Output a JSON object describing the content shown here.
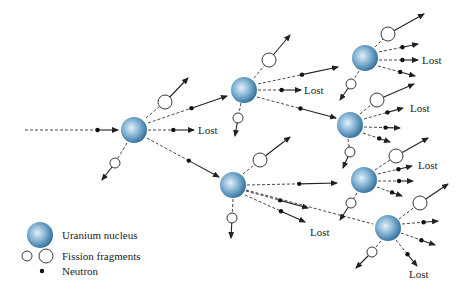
{
  "diagram": {
    "colors": {
      "nucleus_light": "#dcebf4",
      "nucleus_mid": "#7fb0d2",
      "nucleus_dark": "#2f6f9c",
      "line": "#222222"
    },
    "lost_label": "Lost",
    "nuclei": [
      {
        "id": "n1",
        "x": 134,
        "y": 130
      },
      {
        "id": "n2",
        "x": 244,
        "y": 90
      },
      {
        "id": "n3",
        "x": 365,
        "y": 58
      },
      {
        "id": "n4",
        "x": 350,
        "y": 125
      },
      {
        "id": "n5",
        "x": 364,
        "y": 180
      },
      {
        "id": "n6",
        "x": 388,
        "y": 228
      },
      {
        "id": "n7",
        "x": 233,
        "y": 185
      }
    ],
    "neutron_paths": [
      {
        "x1": 25,
        "y1": 130,
        "x2": 118,
        "y2": 130,
        "dot": 0.78,
        "lost": false
      },
      {
        "x1": 148,
        "y1": 130,
        "x2": 194,
        "y2": 130,
        "dot": 0.55,
        "lost": true,
        "lx": 198,
        "ly": 134
      },
      {
        "x1": 148,
        "y1": 123,
        "x2": 227,
        "y2": 96,
        "dot": 0.55,
        "lost": false
      },
      {
        "x1": 147,
        "y1": 138,
        "x2": 219,
        "y2": 177,
        "dot": 0.58,
        "lost": false
      },
      {
        "x1": 258,
        "y1": 90,
        "x2": 301,
        "y2": 90,
        "dot": 0.55,
        "lost": true,
        "lx": 304,
        "ly": 94
      },
      {
        "x1": 258,
        "y1": 84,
        "x2": 338,
        "y2": 67,
        "dot": 0.55,
        "lost": false
      },
      {
        "x1": 257,
        "y1": 97,
        "x2": 336,
        "y2": 118,
        "dot": 0.55,
        "lost": false
      },
      {
        "x1": 247,
        "y1": 185,
        "x2": 337,
        "y2": 183,
        "dot": 0.58,
        "lost": false
      },
      {
        "x1": 246,
        "y1": 191,
        "x2": 308,
        "y2": 208,
        "dot": 0.55,
        "lost": false
      },
      {
        "x1": 245,
        "y1": 195,
        "x2": 305,
        "y2": 222,
        "dot": 0.6,
        "lost": true,
        "lx": 310,
        "ly": 236
      },
      {
        "x1": 246,
        "y1": 190,
        "x2": 373,
        "y2": 224,
        "dot": -1,
        "lost": false
      },
      {
        "x1": 379,
        "y1": 52,
        "x2": 418,
        "y2": 44,
        "dot": 0.6,
        "lost": false
      },
      {
        "x1": 379,
        "y1": 60,
        "x2": 418,
        "y2": 60,
        "dot": 0.6,
        "lost": true,
        "lx": 422,
        "ly": 64
      },
      {
        "x1": 378,
        "y1": 66,
        "x2": 415,
        "y2": 76,
        "dot": 0.6,
        "lost": false
      },
      {
        "x1": 364,
        "y1": 119,
        "x2": 403,
        "y2": 108,
        "dot": 0.6,
        "lost": true,
        "lx": 410,
        "ly": 112
      },
      {
        "x1": 364,
        "y1": 127,
        "x2": 400,
        "y2": 128,
        "dot": 0.6,
        "lost": false
      },
      {
        "x1": 363,
        "y1": 133,
        "x2": 390,
        "y2": 142,
        "dot": 0.6,
        "lost": false
      },
      {
        "x1": 378,
        "y1": 174,
        "x2": 412,
        "y2": 166,
        "dot": 0.6,
        "lost": true,
        "lx": 418,
        "ly": 169
      },
      {
        "x1": 378,
        "y1": 181,
        "x2": 413,
        "y2": 181,
        "dot": 0.6,
        "lost": false
      },
      {
        "x1": 377,
        "y1": 187,
        "x2": 402,
        "y2": 196,
        "dot": 0.6,
        "lost": false
      },
      {
        "x1": 402,
        "y1": 224,
        "x2": 438,
        "y2": 221,
        "dot": 0.6,
        "lost": false
      },
      {
        "x1": 401,
        "y1": 233,
        "x2": 435,
        "y2": 245,
        "dot": 0.6,
        "lost": false
      },
      {
        "x1": 396,
        "y1": 240,
        "x2": 417,
        "y2": 266,
        "dot": 0.55,
        "lost": true,
        "lx": 409,
        "ly": 278
      }
    ],
    "fragments": [
      {
        "x": 165,
        "y": 102,
        "r": 7,
        "sx": 146,
        "sy": 118,
        "ex": 188,
        "ey": 78
      },
      {
        "x": 115,
        "y": 163,
        "r": 5,
        "sx": 127,
        "sy": 143,
        "ex": 102,
        "ey": 180
      },
      {
        "x": 269,
        "y": 60,
        "r": 7,
        "sx": 254,
        "sy": 78,
        "ex": 290,
        "ey": 35
      },
      {
        "x": 238,
        "y": 118,
        "r": 5,
        "sx": 241,
        "sy": 103,
        "ex": 235,
        "ey": 136
      },
      {
        "x": 388,
        "y": 34,
        "r": 7,
        "sx": 375,
        "sy": 47,
        "ex": 424,
        "ey": 14
      },
      {
        "x": 351,
        "y": 84,
        "r": 5,
        "sx": 359,
        "sy": 71,
        "ex": 340,
        "ey": 100
      },
      {
        "x": 377,
        "y": 100,
        "r": 7,
        "sx": 360,
        "sy": 114,
        "ex": 414,
        "ey": 84
      },
      {
        "x": 350,
        "y": 152,
        "r": 5,
        "sx": 348,
        "sy": 139,
        "ex": 343,
        "ey": 168
      },
      {
        "x": 396,
        "y": 156,
        "r": 7,
        "sx": 375,
        "sy": 170,
        "ex": 428,
        "ey": 138
      },
      {
        "x": 351,
        "y": 203,
        "r": 5,
        "sx": 357,
        "sy": 193,
        "ex": 340,
        "ey": 220
      },
      {
        "x": 260,
        "y": 160,
        "r": 7,
        "sx": 243,
        "sy": 174,
        "ex": 290,
        "ey": 137
      },
      {
        "x": 232,
        "y": 218,
        "r": 5,
        "sx": 233,
        "sy": 199,
        "ex": 231,
        "ey": 238
      },
      {
        "x": 420,
        "y": 203,
        "r": 7,
        "sx": 399,
        "sy": 219,
        "ex": 448,
        "ey": 184
      },
      {
        "x": 372,
        "y": 252,
        "r": 5,
        "sx": 381,
        "sy": 241,
        "ex": 356,
        "ey": 268
      }
    ],
    "legend": {
      "uranium_label": "Uranium nucleus",
      "fragments_label": "Fission fragments",
      "neutron_label": "Neutron"
    }
  }
}
